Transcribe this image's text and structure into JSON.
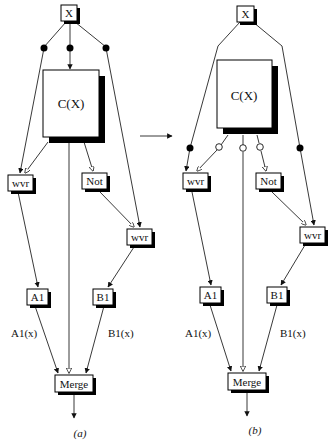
{
  "panels": [
    {
      "caption": "(a)",
      "nodes": {
        "x": "X",
        "c": "C(X)",
        "wvr_left": "wvr",
        "not": "Not",
        "wvr_right": "wvr",
        "a1": "A1",
        "b1": "B1",
        "merge": "Merge"
      },
      "edge_labels": {
        "a1x": "A1(x)",
        "b1x": "B1(x)"
      }
    },
    {
      "caption": "(b)",
      "nodes": {
        "x": "X",
        "c": "C(X)",
        "wvr_left": "wvr",
        "not": "Not",
        "wvr_right": "wvr",
        "a1": "A1",
        "b1": "B1",
        "merge": "Merge"
      },
      "edge_labels": {
        "a1x": "A1(x)",
        "b1x": "B1(x)"
      }
    }
  ],
  "legend": {
    "filled_dot": "control/split point",
    "open_dot": "condition output",
    "transform_arrow": "right-arrow"
  }
}
